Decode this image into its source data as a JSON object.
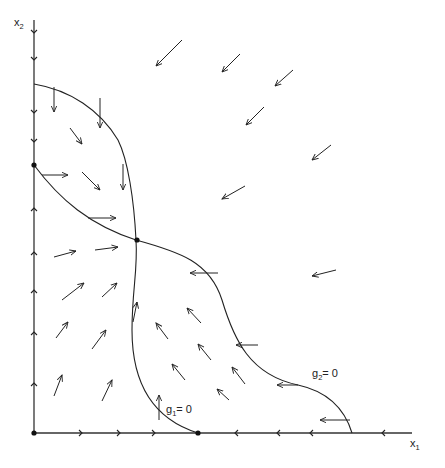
{
  "diagram": {
    "type": "phase-portrait",
    "axes": {
      "x_label": "x",
      "x_subscript": "1",
      "y_label": "x",
      "y_subscript": "2"
    },
    "nullclines": [
      {
        "name": "g1",
        "label": "g",
        "subscript": "1",
        "suffix": "= 0"
      },
      {
        "name": "g2",
        "label": "g",
        "subscript": "2",
        "suffix": "= 0"
      }
    ],
    "equilibria": [
      "origin",
      "x2-axis-saddle",
      "interior-saddle",
      "x1-axis-node"
    ],
    "color": "#222222"
  }
}
